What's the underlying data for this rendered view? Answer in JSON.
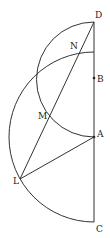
{
  "diagram": {
    "stroke_color": "#333333",
    "background": "#ffffff",
    "points": [
      {
        "name": "D",
        "x": 94,
        "y": 22,
        "label_dx": 3,
        "label_dy": -4
      },
      {
        "name": "N",
        "x": 80,
        "y": 50,
        "label_dx": -10,
        "label_dy": -2
      },
      {
        "name": "B",
        "x": 94,
        "y": 78,
        "label_dx": 3,
        "label_dy": 3
      },
      {
        "name": "M",
        "x": 51,
        "y": 115,
        "label_dx": -11,
        "label_dy": 3
      },
      {
        "name": "A",
        "x": 94,
        "y": 137,
        "label_dx": 3,
        "label_dy": -2
      },
      {
        "name": "L",
        "x": 20,
        "y": 179,
        "label_dx": -7,
        "label_dy": 5
      },
      {
        "name": "C",
        "x": 94,
        "y": 222,
        "label_dx": 3,
        "label_dy": 9
      }
    ],
    "labels": {
      "D": "D",
      "N": "N",
      "B": "B",
      "M": "M",
      "A": "A",
      "L": "L",
      "C": "C"
    },
    "segments": [
      {
        "from": "D",
        "to": "C"
      },
      {
        "from": "D",
        "to": "L"
      },
      {
        "from": "L",
        "to": "A"
      }
    ],
    "arcs": [
      {
        "center": "A",
        "radius": 85,
        "from": "C",
        "to_angle_desc": "up to vertical line near y=52"
      },
      {
        "center": "B",
        "radius": 57,
        "from": "D",
        "to": "A"
      }
    ]
  }
}
